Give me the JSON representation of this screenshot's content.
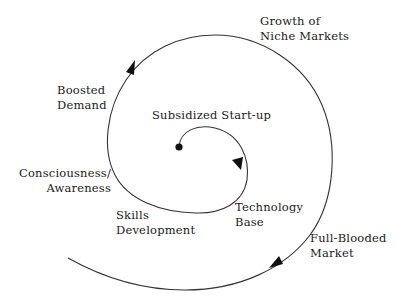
{
  "diagram": {
    "type": "spiral",
    "stroke_color": "#333333",
    "background": "#ffffff",
    "start_point": "center-dot",
    "labels": [
      {
        "id": "subsidized-startup",
        "lines": [
          "Subsidized Start-up"
        ]
      },
      {
        "id": "technology-base",
        "lines": [
          "Technology",
          "Base"
        ]
      },
      {
        "id": "skills-development",
        "lines": [
          "Skills",
          "Development"
        ]
      },
      {
        "id": "consciousness-awareness",
        "lines": [
          "Consciousness/",
          "Awareness"
        ]
      },
      {
        "id": "boosted-demand",
        "lines": [
          "Boosted",
          "Demand"
        ]
      },
      {
        "id": "growth-niche-markets",
        "lines": [
          "Growth of",
          "Niche Markets"
        ]
      },
      {
        "id": "full-blooded-market",
        "lines": [
          "Full-Blooded",
          "Market"
        ]
      }
    ]
  }
}
